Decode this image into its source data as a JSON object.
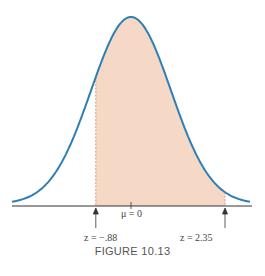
{
  "chart_data": {
    "type": "area",
    "title": "",
    "caption": "FIGURE 10.13",
    "distribution": "normal",
    "mean_label": "μ = 0",
    "shaded_region": {
      "from_z": -0.88,
      "to_z": 2.35
    },
    "tick_labels": [
      "z = −.88",
      "μ = 0",
      "z = 2.35"
    ],
    "xlabel": "",
    "ylabel": "",
    "grid": false,
    "colors": {
      "curve": "#2f7fb5",
      "fill": "#f5d9c6",
      "axis": "#333333",
      "dashed": "#c9856a"
    }
  },
  "labels": {
    "mu": "μ = 0",
    "z_left": "z = −.88",
    "z_right": "z = 2.35",
    "caption": "FIGURE 10.13"
  }
}
